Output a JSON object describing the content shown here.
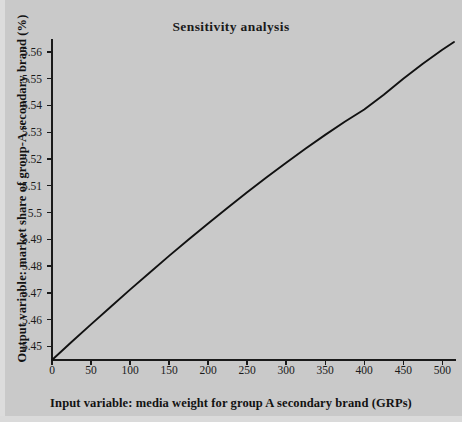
{
  "figure": {
    "title": "Sensitivity analysis",
    "background_color": "#c9c9c9",
    "line_color": "#111111",
    "axis_color": "#1a1a1a"
  },
  "chart_data": {
    "type": "line",
    "title": "Sensitivity analysis",
    "xlabel": "Input variable: media weight for group A secondary brand (GRPs)",
    "ylabel": "Output variable: market share of group-A secondary brand (%)",
    "xlim": [
      0,
      515
    ],
    "ylim": [
      5.4449,
      5.5637
    ],
    "grid": false,
    "legend": null,
    "xticks": [
      0,
      50,
      100,
      150,
      200,
      250,
      300,
      350,
      400,
      450,
      500
    ],
    "xtick_labels": [
      "0",
      "50",
      "100",
      "150",
      "200",
      "250",
      "300",
      "350",
      "400",
      "450",
      "500"
    ],
    "yticks": [
      5.45,
      5.46,
      5.47,
      5.48,
      5.49,
      5.5,
      5.51,
      5.52,
      5.53,
      5.54,
      5.55,
      5.56
    ],
    "ytick_labels": [
      "5.45",
      "5.46",
      "5.47",
      "5.48",
      "5.49",
      "5.5",
      "5.51",
      "5.52",
      "5.53",
      "5.54",
      "5.55",
      "5.56"
    ],
    "series": [
      {
        "name": "market share response",
        "x": [
          0,
          25,
          50,
          75,
          100,
          125,
          150,
          175,
          200,
          225,
          250,
          275,
          300,
          325,
          350,
          375,
          400,
          425,
          450,
          475,
          500,
          515
        ],
        "y": [
          5.4449,
          5.4516,
          5.4582,
          5.4647,
          5.4712,
          5.4775,
          5.4838,
          5.4899,
          5.4959,
          5.5018,
          5.5076,
          5.5132,
          5.5186,
          5.5239,
          5.529,
          5.5339,
          5.5385,
          5.544,
          5.55,
          5.5556,
          5.5608,
          5.5637
        ]
      }
    ]
  }
}
